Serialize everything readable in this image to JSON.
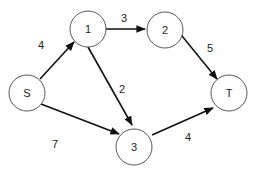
{
  "graph": {
    "type": "directed-weighted-network",
    "nodes": [
      {
        "id": "S",
        "label": "S"
      },
      {
        "id": "1",
        "label": "1"
      },
      {
        "id": "2",
        "label": "2"
      },
      {
        "id": "3",
        "label": "3"
      },
      {
        "id": "T",
        "label": "T"
      }
    ],
    "edges": [
      {
        "from": "S",
        "to": "1",
        "weight": "4"
      },
      {
        "from": "1",
        "to": "2",
        "weight": "3"
      },
      {
        "from": "1",
        "to": "3",
        "weight": "2"
      },
      {
        "from": "2",
        "to": "T",
        "weight": "5"
      },
      {
        "from": "S",
        "to": "3",
        "weight": "7"
      },
      {
        "from": "3",
        "to": "T",
        "weight": "4"
      }
    ]
  }
}
